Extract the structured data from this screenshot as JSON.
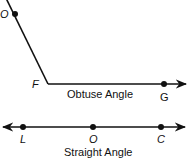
{
  "colors": {
    "stroke": "#111111",
    "background": "#ffffff"
  },
  "obtuse_angle": {
    "caption": "Obtuse Angle",
    "vertex_label": "F",
    "ray1_point_label": "O",
    "ray2_point_label": "G"
  },
  "straight_angle": {
    "caption": "Straight Angle",
    "points": [
      {
        "label": "L"
      },
      {
        "label": "O"
      },
      {
        "label": "C"
      }
    ]
  }
}
